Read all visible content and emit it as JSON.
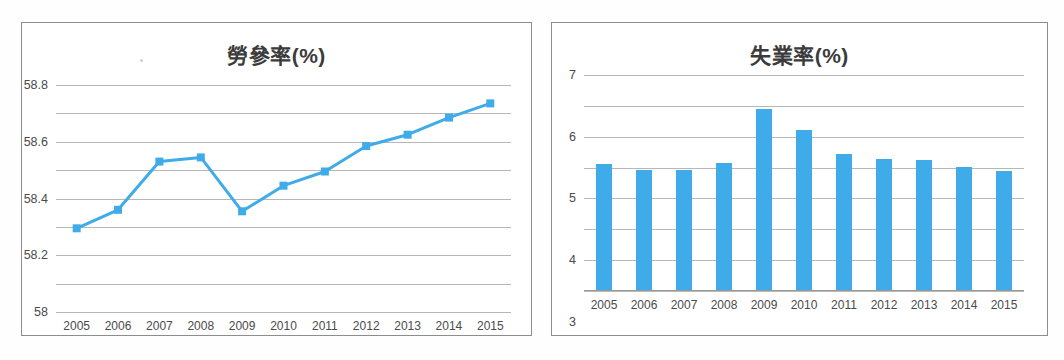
{
  "accent_color": "#3fabe8",
  "grid_color": "#b7b7b7",
  "panels": [
    {
      "name": "labor-participation-rate",
      "title": "勞參率(%)"
    },
    {
      "name": "unemployment-rate",
      "title": "失業率(%)"
    }
  ],
  "chart_data": [
    {
      "type": "line",
      "title": "勞參率(%)",
      "xlabel": "",
      "ylabel": "",
      "categories": [
        "2005",
        "2006",
        "2007",
        "2008",
        "2009",
        "2010",
        "2011",
        "2012",
        "2013",
        "2014",
        "2015"
      ],
      "values": [
        57.79,
        57.92,
        58.26,
        58.29,
        57.91,
        58.09,
        58.19,
        58.37,
        58.45,
        58.57,
        58.67
      ],
      "ylim": [
        57.2,
        58.8
      ],
      "yticks": [
        "58.8",
        "58.6",
        "58.4",
        "58.2",
        "58",
        "57.8",
        "57.6",
        "57.4",
        "57.2"
      ],
      "ytick_values": [
        58.8,
        58.6,
        58.4,
        58.2,
        58.0,
        57.8,
        57.6,
        57.4,
        57.2
      ],
      "grid": true,
      "legend": "none",
      "marker": "square",
      "series_color": "#3fabe8"
    },
    {
      "type": "bar",
      "title": "失業率(%)",
      "xlabel": "",
      "ylabel": "",
      "categories": [
        "2005",
        "2006",
        "2007",
        "2008",
        "2009",
        "2010",
        "2011",
        "2012",
        "2013",
        "2014",
        "2015"
      ],
      "values": [
        4.13,
        3.91,
        3.91,
        4.14,
        5.89,
        5.22,
        4.43,
        4.28,
        4.26,
        4.03,
        3.89
      ],
      "ylim": [
        0,
        7
      ],
      "yticks": [
        "7",
        "6",
        "5",
        "4",
        "3",
        "2",
        "1",
        "0"
      ],
      "ytick_values": [
        7,
        6,
        5,
        4,
        3,
        2,
        1,
        0
      ],
      "grid": true,
      "legend": "none",
      "bar_color": "#3fabe8"
    }
  ]
}
